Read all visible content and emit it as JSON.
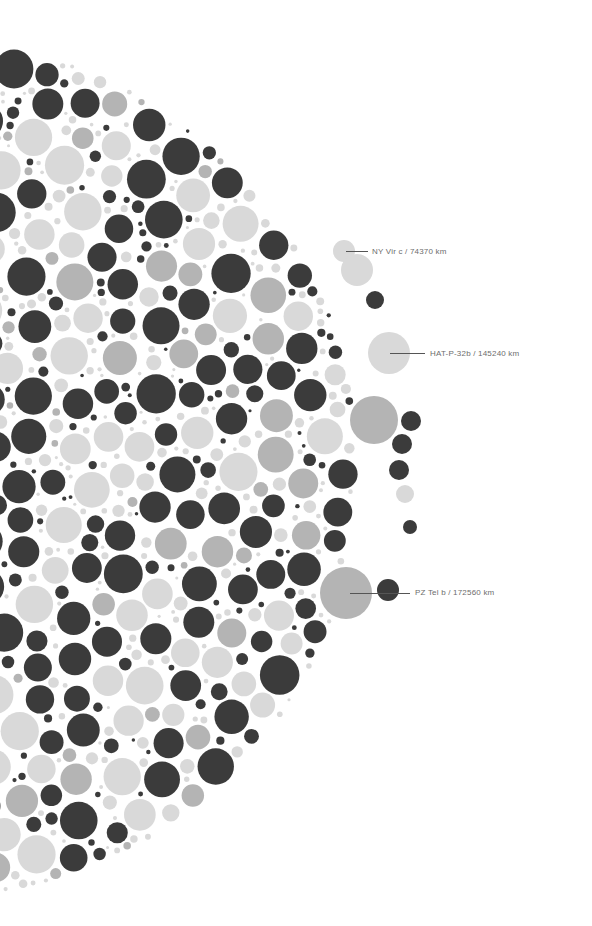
{
  "chart_data": {
    "type": "bubble-packing",
    "title": "",
    "colors": {
      "dark": "#3b3b3b",
      "light": "#d9d9d9",
      "mid": "#b4b4b4",
      "leader": "#555555",
      "label_text": "#6d6d6d",
      "background": "#ffffff"
    },
    "field": {
      "cx": -70,
      "cy": 470,
      "radius": 430
    },
    "annotations": [
      {
        "name": "NY Vir c",
        "radius_km": 74370,
        "label": "NY Vir c / 74370 km",
        "cx": 344,
        "cy": 251,
        "r": 11,
        "color": "light",
        "line_x1": 346,
        "line_x2": 368,
        "label_x": 372,
        "label_y": 247
      },
      {
        "name": "HAT-P-32b",
        "radius_km": 145240,
        "label": "HAT-P-32b / 145240 km",
        "cx": 389,
        "cy": 353,
        "r": 21,
        "color": "light",
        "line_x1": 390,
        "line_x2": 425,
        "label_x": 430,
        "label_y": 349
      },
      {
        "name": "PZ Tel b",
        "radius_km": 172560,
        "label": "PZ Tel b / 172560 km",
        "cx": 346,
        "cy": 593,
        "r": 26,
        "color": "mid",
        "line_x1": 350,
        "line_x2": 410,
        "label_x": 415,
        "label_y": 588
      }
    ],
    "notable_circles": [
      {
        "cx": 374,
        "cy": 420,
        "r": 24,
        "color": "mid"
      },
      {
        "cx": 411,
        "cy": 421,
        "r": 10,
        "color": "dark"
      },
      {
        "cx": 402,
        "cy": 444,
        "r": 10,
        "color": "dark"
      },
      {
        "cx": 399,
        "cy": 470,
        "r": 10,
        "color": "dark"
      },
      {
        "cx": 405,
        "cy": 494,
        "r": 9,
        "color": "light"
      },
      {
        "cx": 410,
        "cy": 527,
        "r": 7,
        "color": "dark"
      },
      {
        "cx": 375,
        "cy": 300,
        "r": 9,
        "color": "dark"
      },
      {
        "cx": 388,
        "cy": 590,
        "r": 11,
        "color": "dark"
      },
      {
        "cx": 357,
        "cy": 270,
        "r": 16,
        "color": "light"
      }
    ]
  }
}
